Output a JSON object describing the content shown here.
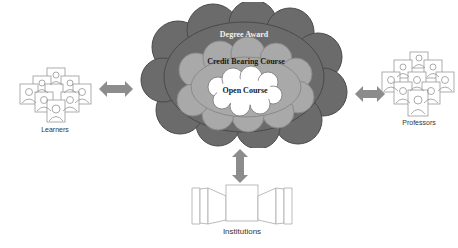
{
  "diagram": {
    "clouds": {
      "outer": {
        "label": "Degree Award",
        "fill": "#6b6b6b",
        "text_color": "#f2f2f2"
      },
      "middle": {
        "label": "Credit Bearing Course",
        "fill": "#a9a9a9",
        "text_color": "#1a1a1a"
      },
      "inner": {
        "label": "Open Course",
        "fill": "#ffffff",
        "text_color": "#1a1a1a"
      }
    },
    "actors": {
      "learners": {
        "label": "Learners",
        "icon": "people-group-icon"
      },
      "professors": {
        "label": "Professors",
        "icon": "people-group-icon"
      },
      "institutions": {
        "label": "Institutions",
        "icon": "building-icon"
      }
    },
    "arrows": [
      {
        "from": "learners",
        "to": "cloud",
        "type": "bidirectional-horizontal",
        "color": "#8c8c8c"
      },
      {
        "from": "professors",
        "to": "cloud",
        "type": "bidirectional-horizontal",
        "color": "#8c8c8c"
      },
      {
        "from": "institutions",
        "to": "cloud",
        "type": "bidirectional-vertical",
        "color": "#8c8c8c"
      }
    ]
  }
}
